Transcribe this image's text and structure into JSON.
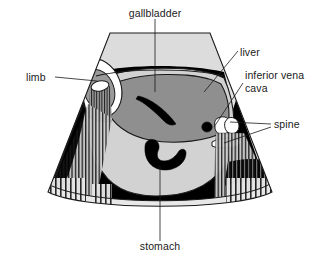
{
  "figure": {
    "type": "ultrasound-sector-scan-diagram",
    "title_visible": false,
    "background_color": "#ffffff",
    "outline_color": "#1a1a1a"
  },
  "palette": {
    "near_field_gray": "#dcdcdc",
    "fluid_black": "#000000",
    "liver_gray": "#8f8f8f",
    "body_gray": "#d2d2d2",
    "bone_white": "#ffffff",
    "shadow_stripe": "#1a1a1a",
    "far_field_gray": "#e2e2e2",
    "text_color": "#1a1a1a"
  },
  "labels": [
    {
      "id": "gallbladder",
      "text": "gallbladder",
      "x": 155,
      "y": 14,
      "anchor": "middle",
      "leader": "M155,19 L155,92"
    },
    {
      "id": "liver",
      "text": "liver",
      "x": 240,
      "y": 56,
      "anchor": "start",
      "leader": "M238,53 L205,90"
    },
    {
      "id": "inferior-vena-cava-line1",
      "text": "inferior vena",
      "x": 245,
      "y": 78,
      "anchor": "start",
      "leader": "M243,80 L213,126"
    },
    {
      "id": "inferior-vena-cava-line2",
      "text": "cava",
      "x": 245,
      "y": 91,
      "anchor": "start",
      "leader": ""
    },
    {
      "id": "spine",
      "text": "spine",
      "x": 273,
      "y": 128,
      "anchor": "start",
      "leader": "M271,125 L231,123"
    },
    {
      "id": "spine-second",
      "text": "",
      "x": 273,
      "y": 128,
      "anchor": "start",
      "leader": "M271,128 L225,143"
    },
    {
      "id": "limb",
      "text": "limb",
      "x": 26,
      "y": 80,
      "anchor": "start",
      "leader": "M54,77 L96,77"
    },
    {
      "id": "stomach",
      "text": "stomach",
      "x": 160,
      "y": 249,
      "anchor": "middle",
      "leader": "M160,243 L160,166"
    }
  ],
  "anatomy": [
    {
      "id": "sector-field",
      "name": "ultrasound-sector-field"
    },
    {
      "id": "near-field-band",
      "name": "near-field-tissue-band"
    },
    {
      "id": "amniotic-fluid",
      "name": "amniotic-fluid-anechoic-band"
    },
    {
      "id": "liver",
      "name": "fetal-liver"
    },
    {
      "id": "gallbladder",
      "name": "fetal-gallbladder"
    },
    {
      "id": "stomach",
      "name": "fetal-stomach"
    },
    {
      "id": "aorta",
      "name": "descending-aorta"
    },
    {
      "id": "ivc",
      "name": "inferior-vena-cava"
    },
    {
      "id": "spine-body",
      "name": "vertebral-body"
    },
    {
      "id": "spine-posterior",
      "name": "posterior-vertebral-element"
    },
    {
      "id": "limb",
      "name": "fetal-limb-cross-section"
    },
    {
      "id": "limb-bone",
      "name": "limb-bone"
    },
    {
      "id": "shadow-left",
      "name": "acoustic-shadow-left"
    },
    {
      "id": "shadow-right",
      "name": "acoustic-shadow-right"
    },
    {
      "id": "far-field-band",
      "name": "far-field-tissue-band"
    }
  ]
}
